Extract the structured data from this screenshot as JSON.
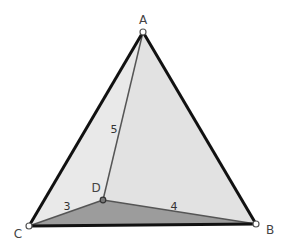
{
  "diagram": {
    "type": "tetrahedron-geometry",
    "points": {
      "A": {
        "label": "A",
        "x": 143,
        "y": 32,
        "label_x": 143,
        "label_y": 24
      },
      "B": {
        "label": "B",
        "x": 256,
        "y": 224,
        "label_x": 270,
        "label_y": 234
      },
      "C": {
        "label": "C",
        "x": 29,
        "y": 226,
        "label_x": 18,
        "label_y": 238
      },
      "D": {
        "label": "D",
        "x": 103,
        "y": 200,
        "label_x": 96,
        "label_y": 192
      }
    },
    "edge_labels": {
      "AD": {
        "text": "5",
        "x": 114,
        "y": 133
      },
      "CD": {
        "text": "3",
        "x": 67,
        "y": 210
      },
      "BD": {
        "text": "4",
        "x": 174,
        "y": 210
      }
    },
    "colors": {
      "face_ACD": "#e8e8e8",
      "face_ABD": "#e0e0e0",
      "face_BCD": "#9a9a9a",
      "outer_edge": "#111111",
      "inner_edge": "#555555",
      "vertex_fill": "#ffffff",
      "vertex_stroke": "#555555",
      "vertex_D_fill": "#777777"
    }
  }
}
